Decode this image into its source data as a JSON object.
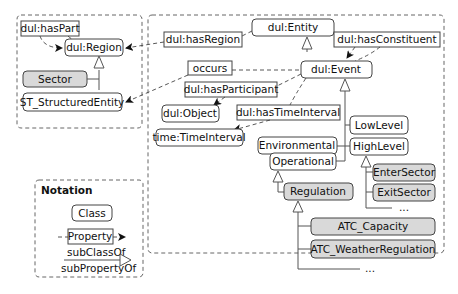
{
  "diagram": {
    "type": "ontology-class-diagram",
    "left_module": {
      "classes": {
        "region": "dul:Region",
        "sector": "Sector",
        "st_structured_entity": "ST_StructuredEntity"
      },
      "properties": {
        "has_part": "dul:hasPart"
      }
    },
    "main_module": {
      "classes": {
        "entity": "dul:Entity",
        "event": "dul:Event",
        "object": "dul:Object",
        "time_interval": "time:TimeInterval",
        "low_level": "LowLevel",
        "high_level": "HighLevel",
        "environmental": "Environmental",
        "operational": "Operational",
        "enter_sector": "EnterSector",
        "exit_sector": "ExitSector",
        "regulation": "Regulation",
        "atc_capacity": "ATC_Capacity",
        "atc_weather_regulation": "ATC_WeatherRegulation",
        "ellipsis_high": "...",
        "ellipsis_reg": "..."
      },
      "properties": {
        "has_region": "dul:hasRegion",
        "has_constituent": "dul:hasConstituent",
        "occurs": "occurs",
        "has_participant": "dul:hasParticipant",
        "has_time_interval": "dul:hasTimeInterval"
      }
    },
    "notation": {
      "title": "Notation",
      "class_label": "Class",
      "property_label": "Property",
      "subclass_label": "subClassOf",
      "subproperty_label": "subPropertyOf"
    },
    "colors": {
      "class_fill": "#ffffff",
      "highlight_fill": "#d9d9d9",
      "stroke": "#444444"
    }
  }
}
